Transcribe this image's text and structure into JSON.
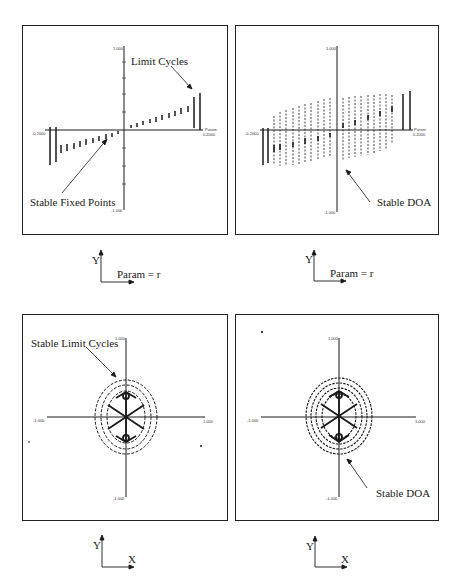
{
  "figure": {
    "panels": [
      {
        "id": "top-left",
        "annotations": [
          "Limit Cycles",
          "Stable Fixed Points"
        ],
        "ticks": {
          "y_top": "1.000",
          "y_bottom": "-1.000",
          "x_left": "-0.2000",
          "x_right": "0.2000",
          "x_name": "Param"
        },
        "axis_indicator": {
          "y": "Y",
          "x": "Param = r"
        }
      },
      {
        "id": "top-right",
        "annotations": [
          "Stable DOA"
        ],
        "ticks": {
          "y_top": "1.000",
          "y_bottom": "-1.000",
          "x_left": "-0.2000",
          "x_right": "0.2000",
          "x_name": "Param"
        },
        "axis_indicator": {
          "y": "Y",
          "x": "Param = r"
        }
      },
      {
        "id": "bottom-left",
        "annotations": [
          "Stable Limit Cycles"
        ],
        "ticks": {
          "y_top": "1.000",
          "y_bottom": "-1.000",
          "x_left": "-1.000",
          "x_right": "1.000"
        },
        "axis_indicator": {
          "y": "Y",
          "x": "X"
        }
      },
      {
        "id": "bottom-right",
        "annotations": [
          "Stable DOA"
        ],
        "ticks": {
          "y_top": "1.000",
          "y_bottom": "-1.000",
          "x_left": "-1.000",
          "x_right": "1.000"
        },
        "axis_indicator": {
          "y": "Y",
          "x": "X"
        }
      }
    ]
  },
  "colors": {
    "ink": "#1a1a1a",
    "paper": "#ffffff"
  }
}
